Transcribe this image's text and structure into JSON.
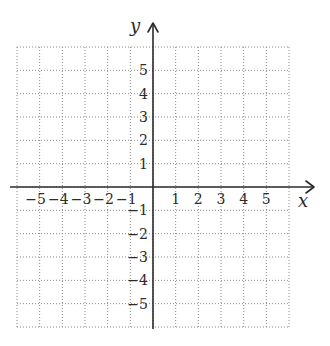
{
  "diagram": {
    "type": "coordinate-plane",
    "x_axis": {
      "label": "x",
      "min": -6,
      "max": 6,
      "tick_labels": [
        {
          "value": -5,
          "text": "−5"
        },
        {
          "value": -4,
          "text": "−4"
        },
        {
          "value": -3,
          "text": "−3"
        },
        {
          "value": -2,
          "text": "−2"
        },
        {
          "value": -1,
          "text": "−1"
        },
        {
          "value": 1,
          "text": "1"
        },
        {
          "value": 2,
          "text": "2"
        },
        {
          "value": 3,
          "text": "3"
        },
        {
          "value": 4,
          "text": "4"
        },
        {
          "value": 5,
          "text": "5"
        }
      ]
    },
    "y_axis": {
      "label": "y",
      "min": -6,
      "max": 6,
      "tick_labels": [
        {
          "value": 5,
          "text": "5"
        },
        {
          "value": 4,
          "text": "4"
        },
        {
          "value": 3,
          "text": "3"
        },
        {
          "value": 2,
          "text": "2"
        },
        {
          "value": 1,
          "text": "1"
        },
        {
          "value": -1,
          "text": "−1"
        },
        {
          "value": -2,
          "text": "−2"
        },
        {
          "value": -3,
          "text": "−3"
        },
        {
          "value": -4,
          "text": "−4"
        },
        {
          "value": -5,
          "text": "−5"
        }
      ]
    },
    "grid": {
      "style": "dotted",
      "cells_x": 12,
      "cells_y": 12
    },
    "colors": {
      "axis": "#2b2b2b",
      "grid": "#8a8a8a",
      "background": "#ffffff"
    }
  }
}
